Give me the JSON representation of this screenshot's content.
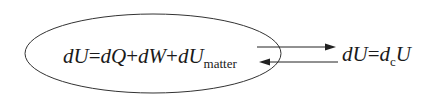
{
  "diagram": {
    "left_equation": {
      "parts": [
        "dU",
        "=",
        "dQ",
        "+",
        "dW",
        "+",
        "dU"
      ],
      "subscript": "matter"
    },
    "right_equation": {
      "lhs": "dU",
      "eq": "=",
      "d": "d",
      "subscript": "c",
      "U": "U"
    },
    "arrows": [
      {
        "direction": "right",
        "from": "ellipse",
        "to": "right_equation"
      },
      {
        "direction": "left",
        "from": "right_equation",
        "to": "ellipse"
      }
    ],
    "colors": {
      "stroke": "#333333",
      "text": "#1a1a1a",
      "background": "#ffffff"
    }
  }
}
